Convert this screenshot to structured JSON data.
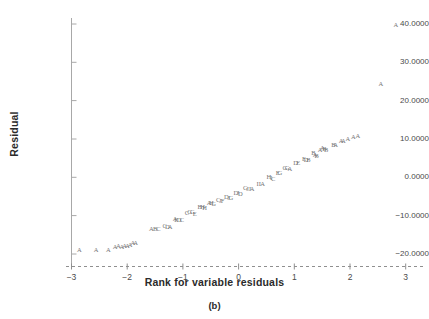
{
  "figure": {
    "caption": "(b)",
    "xlabel": "Rank for variable residuals",
    "ylabel": "Residual",
    "marker_color": "#767676",
    "axis_color": "#9a9a9a",
    "text_color": "#3a3a3a"
  },
  "chart_data": {
    "type": "scatter",
    "title": "(b)",
    "xlabel": "Rank for variable residuals",
    "ylabel": "Residual",
    "xlim": [
      -3.2,
      3.25
    ],
    "ylim": [
      -22.5,
      43.0
    ],
    "grid": false,
    "legend": null,
    "xticks": [
      -3,
      -2,
      -1,
      0,
      1,
      2,
      3
    ],
    "xtick_labels": [
      "−3",
      "−2",
      "−1",
      "0",
      "1",
      "2",
      "3"
    ],
    "yticks": [
      -20,
      -10,
      0,
      10,
      20,
      30,
      40
    ],
    "ytick_labels": [
      "−20.0000",
      "−10.0000",
      "0.0000",
      "10.0000",
      "20.0000",
      "30.0000",
      "40.0000"
    ],
    "marker_style": "letter-coded",
    "points": [
      {
        "x": -2.86,
        "y": -18.6,
        "label": "A"
      },
      {
        "x": -2.56,
        "y": -18.6,
        "label": "A"
      },
      {
        "x": -2.34,
        "y": -18.7,
        "label": "A"
      },
      {
        "x": -2.22,
        "y": -17.9,
        "label": "A"
      },
      {
        "x": -2.16,
        "y": -17.7,
        "label": "A"
      },
      {
        "x": -2.1,
        "y": -17.8,
        "label": "A"
      },
      {
        "x": -2.05,
        "y": -17.6,
        "label": "A"
      },
      {
        "x": -2.0,
        "y": -17.7,
        "label": "A"
      },
      {
        "x": -1.95,
        "y": -17.5,
        "label": "A"
      },
      {
        "x": -1.9,
        "y": -16.9,
        "label": "A"
      },
      {
        "x": -1.85,
        "y": -16.8,
        "label": "A"
      },
      {
        "x": -1.57,
        "y": -13.2,
        "label": "A"
      },
      {
        "x": -1.5,
        "y": -13.2,
        "label": "B"
      },
      {
        "x": -1.44,
        "y": -13.3,
        "label": "C"
      },
      {
        "x": -1.33,
        "y": -12.5,
        "label": "C"
      },
      {
        "x": -1.28,
        "y": -12.6,
        "label": "D"
      },
      {
        "x": -1.23,
        "y": -12.7,
        "label": "A"
      },
      {
        "x": -1.14,
        "y": -10.5,
        "label": "A"
      },
      {
        "x": -1.12,
        "y": -10.9,
        "label": "E"
      },
      {
        "x": -1.07,
        "y": -10.8,
        "label": "D"
      },
      {
        "x": -1.02,
        "y": -10.9,
        "label": "C"
      },
      {
        "x": -0.93,
        "y": -9.0,
        "label": "C"
      },
      {
        "x": -0.88,
        "y": -8.8,
        "label": "G"
      },
      {
        "x": -0.83,
        "y": -8.9,
        "label": "G"
      },
      {
        "x": -0.79,
        "y": -9.2,
        "label": "E"
      },
      {
        "x": -0.7,
        "y": -7.6,
        "label": "B"
      },
      {
        "x": -0.65,
        "y": -7.6,
        "label": "H"
      },
      {
        "x": -0.61,
        "y": -7.8,
        "label": "H"
      },
      {
        "x": -0.53,
        "y": -6.4,
        "label": "A"
      },
      {
        "x": -0.49,
        "y": -6.5,
        "label": "H"
      },
      {
        "x": -0.45,
        "y": -6.8,
        "label": "G"
      },
      {
        "x": -0.37,
        "y": -5.6,
        "label": "C"
      },
      {
        "x": -0.33,
        "y": -5.9,
        "label": "J"
      },
      {
        "x": -0.29,
        "y": -5.9,
        "label": "F"
      },
      {
        "x": -0.22,
        "y": -4.8,
        "label": "D"
      },
      {
        "x": -0.18,
        "y": -5.0,
        "label": "J"
      },
      {
        "x": -0.14,
        "y": -5.1,
        "label": "G"
      },
      {
        "x": -0.05,
        "y": -3.7,
        "label": "D"
      },
      {
        "x": -0.01,
        "y": -3.8,
        "label": "J"
      },
      {
        "x": 0.03,
        "y": -4.0,
        "label": "D"
      },
      {
        "x": 0.12,
        "y": -2.6,
        "label": "G"
      },
      {
        "x": 0.16,
        "y": -2.8,
        "label": "J"
      },
      {
        "x": 0.2,
        "y": -2.8,
        "label": "J"
      },
      {
        "x": 0.24,
        "y": -2.9,
        "label": "A"
      },
      {
        "x": 0.34,
        "y": -1.4,
        "label": "I"
      },
      {
        "x": 0.38,
        "y": -1.4,
        "label": "I"
      },
      {
        "x": 0.43,
        "y": -1.6,
        "label": "A"
      },
      {
        "x": 0.54,
        "y": 0.3,
        "label": "H"
      },
      {
        "x": 0.58,
        "y": 0.1,
        "label": "I"
      },
      {
        "x": 0.62,
        "y": -0.1,
        "label": "C"
      },
      {
        "x": 0.7,
        "y": 1.4,
        "label": "E"
      },
      {
        "x": 0.74,
        "y": 1.4,
        "label": "G"
      },
      {
        "x": 0.83,
        "y": 2.7,
        "label": "G"
      },
      {
        "x": 0.87,
        "y": 2.6,
        "label": "G"
      },
      {
        "x": 0.92,
        "y": 2.4,
        "label": "A"
      },
      {
        "x": 1.02,
        "y": 4.1,
        "label": "D"
      },
      {
        "x": 1.07,
        "y": 4.0,
        "label": "E"
      },
      {
        "x": 1.17,
        "y": 5.0,
        "label": "E"
      },
      {
        "x": 1.21,
        "y": 4.9,
        "label": "D"
      },
      {
        "x": 1.25,
        "y": 4.7,
        "label": "B"
      },
      {
        "x": 1.34,
        "y": 6.6,
        "label": "B"
      },
      {
        "x": 1.37,
        "y": 6.1,
        "label": "A"
      },
      {
        "x": 1.4,
        "y": 5.8,
        "label": "B"
      },
      {
        "x": 1.46,
        "y": 7.4,
        "label": "A"
      },
      {
        "x": 1.5,
        "y": 7.8,
        "label": "A"
      },
      {
        "x": 1.54,
        "y": 7.6,
        "label": "B"
      },
      {
        "x": 1.57,
        "y": 7.5,
        "label": "B"
      },
      {
        "x": 1.7,
        "y": 8.8,
        "label": "B"
      },
      {
        "x": 1.74,
        "y": 8.8,
        "label": "A"
      },
      {
        "x": 1.84,
        "y": 9.7,
        "label": "A"
      },
      {
        "x": 1.88,
        "y": 9.7,
        "label": "A"
      },
      {
        "x": 1.96,
        "y": 10.2,
        "label": "A"
      },
      {
        "x": 2.06,
        "y": 10.7,
        "label": "A"
      },
      {
        "x": 2.14,
        "y": 11.0,
        "label": "A"
      },
      {
        "x": 2.55,
        "y": 24.5,
        "label": "A"
      },
      {
        "x": 2.82,
        "y": 40.0,
        "label": "A"
      }
    ]
  }
}
